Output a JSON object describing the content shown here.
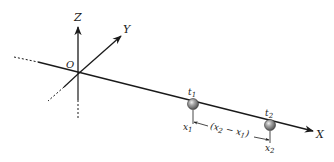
{
  "diagram": {
    "axes": {
      "x_label": "X",
      "y_label": "Y",
      "z_label": "Z",
      "origin_label": "O"
    },
    "particles": [
      {
        "time_label": "t",
        "time_sub": "1",
        "pos_label": "x",
        "pos_sub": "1"
      },
      {
        "time_label": "t",
        "time_sub": "2",
        "pos_label": "x",
        "pos_sub": "2"
      }
    ],
    "displacement": {
      "open": "(x",
      "sub_a": "2",
      "minus": " − x",
      "sub_b": "1",
      "close": ")"
    },
    "colors": {
      "line": "#1a1a1a",
      "ball": "#7a7a7a",
      "ball_highlight": "#e6e6e6",
      "background": "#ffffff"
    }
  }
}
